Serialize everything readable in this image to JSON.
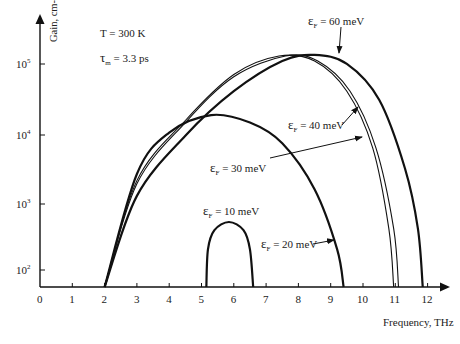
{
  "chart_data": {
    "type": "line",
    "title": "",
    "xlabel": "Frequency, THz",
    "ylabel": "Gain, cm-1",
    "yscale": "log",
    "xlim": [
      0,
      12.5
    ],
    "ylim": [
      60,
      200000
    ],
    "grid": false,
    "x_ticks": [
      "0",
      "1",
      "2",
      "3",
      "4",
      "5",
      "6",
      "7",
      "8",
      "9",
      "10",
      "11",
      "12"
    ],
    "y_ticks": [
      {
        "base": "10",
        "exp": "2"
      },
      {
        "base": "10",
        "exp": "3"
      },
      {
        "base": "10",
        "exp": "4"
      },
      {
        "base": "10",
        "exp": "5"
      }
    ],
    "annotations": {
      "temperature": "T = 300 K",
      "tau_prefix": "τ",
      "tau_sub": "m",
      "tau_value": " = 3.3 ps"
    },
    "series": [
      {
        "name": "εF = 10 meV",
        "label_main": "ε",
        "label_sub": "F",
        "label_value": " = 10 meV",
        "stroke": "thick",
        "points": [
          [
            5.15,
            60
          ],
          [
            5.2,
            200
          ],
          [
            5.4,
            380
          ],
          [
            5.85,
            500
          ],
          [
            6.3,
            380
          ],
          [
            6.5,
            200
          ],
          [
            6.6,
            60
          ]
        ]
      },
      {
        "name": "εF = 20 meV",
        "label_main": "ε",
        "label_sub": "F",
        "label_value": " = 20 meV",
        "stroke": "thick",
        "points": [
          [
            2.0,
            60
          ],
          [
            3.0,
            2500
          ],
          [
            4.0,
            10000
          ],
          [
            5.3,
            18000
          ],
          [
            6.5,
            14000
          ],
          [
            7.5,
            7000
          ],
          [
            8.5,
            1500
          ],
          [
            9.2,
            200
          ],
          [
            9.4,
            60
          ]
        ]
      },
      {
        "name": "εF = 30 meV",
        "label_main": "ε",
        "label_sub": "F",
        "label_value": " = 30 meV",
        "stroke": "thin",
        "points": [
          [
            2.0,
            60
          ],
          [
            3.0,
            2000
          ],
          [
            4.5,
            15000
          ],
          [
            6.0,
            70000
          ],
          [
            7.4,
            130000
          ],
          [
            8.5,
            110000
          ],
          [
            9.5,
            40000
          ],
          [
            10.3,
            6000
          ],
          [
            10.8,
            400
          ],
          [
            10.95,
            60
          ]
        ]
      },
      {
        "name": "εF = 40 meV",
        "label_main": "ε",
        "label_sub": "F",
        "label_value": " = 40 meV",
        "stroke": "thin",
        "points": [
          [
            2.0,
            60
          ],
          [
            3.0,
            1800
          ],
          [
            4.5,
            14000
          ],
          [
            6.0,
            65000
          ],
          [
            7.6,
            130000
          ],
          [
            8.6,
            110000
          ],
          [
            9.6,
            40000
          ],
          [
            10.4,
            6000
          ],
          [
            10.95,
            400
          ],
          [
            11.1,
            60
          ]
        ]
      },
      {
        "name": "εF = 60 meV",
        "label_main": "ε",
        "label_sub": "F",
        "label_value": " = 60 meV",
        "stroke": "thick",
        "points": [
          [
            2.0,
            60
          ],
          [
            3.0,
            1200
          ],
          [
            4.5,
            9000
          ],
          [
            6.0,
            40000
          ],
          [
            7.5,
            110000
          ],
          [
            8.5,
            135000
          ],
          [
            9.5,
            100000
          ],
          [
            10.5,
            30000
          ],
          [
            11.3,
            3000
          ],
          [
            11.7,
            400
          ],
          [
            11.85,
            60
          ]
        ]
      }
    ]
  }
}
